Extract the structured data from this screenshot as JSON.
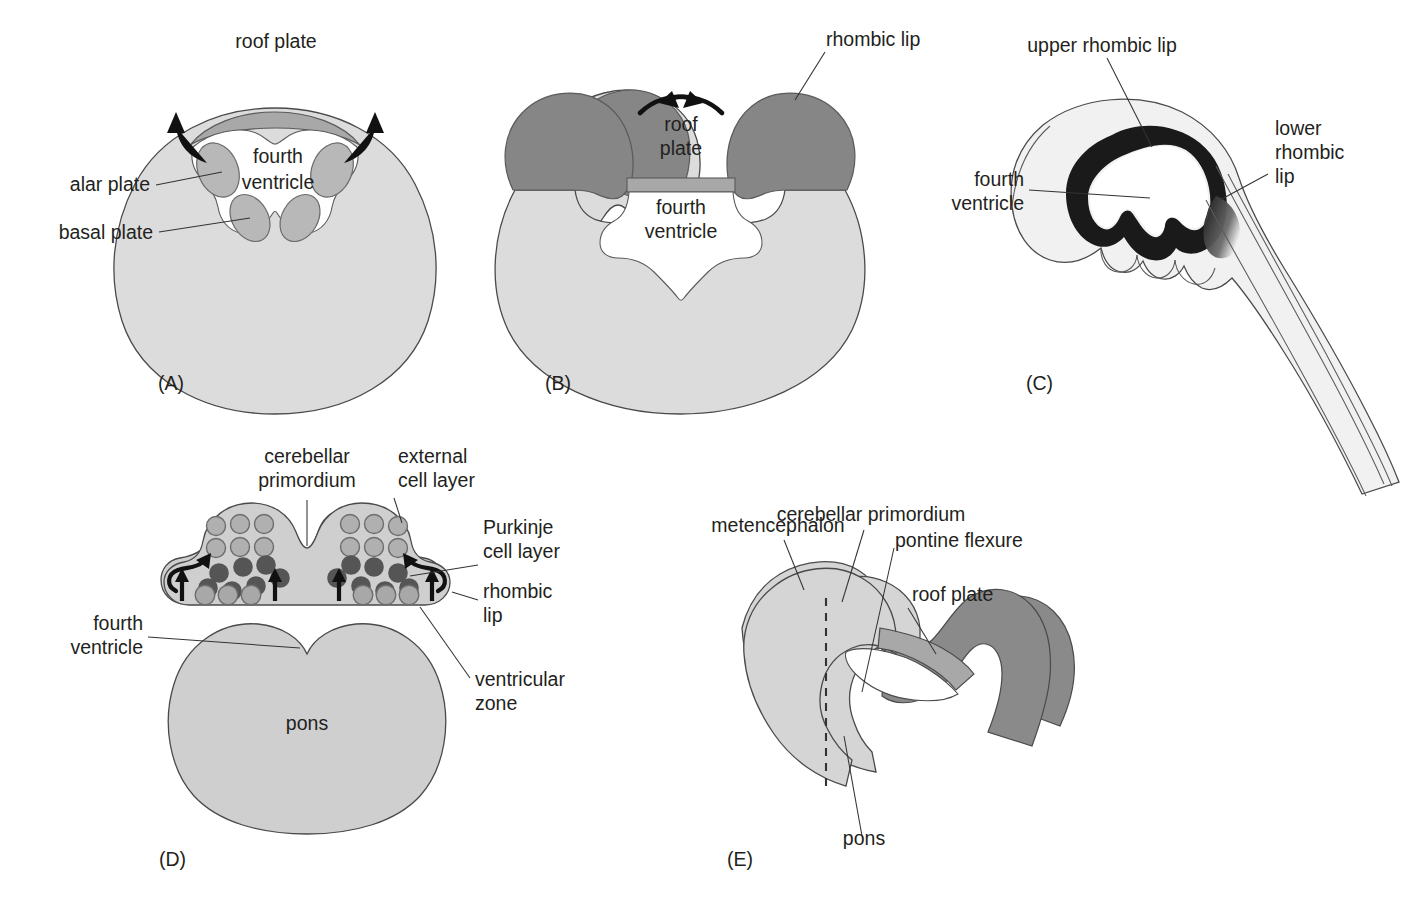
{
  "figure": {
    "background_color": "#ffffff",
    "text_color": "#231f20"
  },
  "colors": {
    "body_light_gray": "#dcdcdc",
    "mid_gray": "#b8b8b8",
    "dark_gray": "#868686",
    "roof_plate_gray": "#a8a8a8",
    "very_light_gray": "#f1f1f1",
    "black": "#1a1a1a",
    "outline": "#4a4a4a",
    "white": "#ffffff",
    "purkinje_cell": "#595959",
    "external_cell": "#b0b0b0",
    "ventricular_cell": "#a8a8a8"
  },
  "panels": [
    {
      "id": "A",
      "letter": "(A)",
      "labels": [
        {
          "name": "roof-plate",
          "text": "roof plate"
        },
        {
          "name": "fourth-ventricle-line1",
          "text": "fourth"
        },
        {
          "name": "fourth-ventricle-line2",
          "text": "ventricle"
        },
        {
          "name": "alar-plate",
          "text": "alar plate"
        },
        {
          "name": "basal-plate",
          "text": "basal plate"
        }
      ]
    },
    {
      "id": "B",
      "letter": "(B)",
      "labels": [
        {
          "name": "rhombic-lip",
          "text": "rhombic lip"
        },
        {
          "name": "roof-plate-line1",
          "text": "roof"
        },
        {
          "name": "roof-plate-line2",
          "text": "plate"
        },
        {
          "name": "fourth-ventricle-line1",
          "text": "fourth"
        },
        {
          "name": "fourth-ventricle-line2",
          "text": "ventricle"
        }
      ]
    },
    {
      "id": "C",
      "letter": "(C)",
      "labels": [
        {
          "name": "upper-rhombic-lip",
          "text": "upper rhombic lip"
        },
        {
          "name": "lower-rhombic-lip-line1",
          "text": "lower"
        },
        {
          "name": "lower-rhombic-lip-line2",
          "text": "rhombic"
        },
        {
          "name": "lower-rhombic-lip-line3",
          "text": "lip"
        },
        {
          "name": "fourth-ventricle-line1",
          "text": "fourth"
        },
        {
          "name": "fourth-ventricle-line2",
          "text": "ventricle"
        }
      ]
    },
    {
      "id": "D",
      "letter": "(D)",
      "labels": [
        {
          "name": "cerebellar-primordium-line1",
          "text": "cerebellar"
        },
        {
          "name": "cerebellar-primordium-line2",
          "text": "primordium"
        },
        {
          "name": "external-cell-layer-line1",
          "text": "external"
        },
        {
          "name": "external-cell-layer-line2",
          "text": "cell layer"
        },
        {
          "name": "purkinje-cell-layer-line1",
          "text": "Purkinje"
        },
        {
          "name": "purkinje-cell-layer-line2",
          "text": "cell layer"
        },
        {
          "name": "rhombic-lip-line1",
          "text": "rhombic"
        },
        {
          "name": "rhombic-lip-line2",
          "text": "lip"
        },
        {
          "name": "ventricular-zone-line1",
          "text": "ventricular"
        },
        {
          "name": "ventricular-zone-line2",
          "text": "zone"
        },
        {
          "name": "fourth-ventricle-line1",
          "text": "fourth"
        },
        {
          "name": "fourth-ventricle-line2",
          "text": "ventricle"
        },
        {
          "name": "pons",
          "text": "pons"
        }
      ],
      "cell_counts": {
        "external_cell_layer_per_side": 6,
        "purkinje_cells_per_side": 7,
        "ventricular_zone_cells_per_side": 3,
        "upward_arrows": 4,
        "curved_arrows": 2
      }
    },
    {
      "id": "E",
      "letter": "(E)",
      "labels": [
        {
          "name": "metencephalon",
          "text": "metencephalon"
        },
        {
          "name": "cerebellar-primordium",
          "text": "cerebellar primordium"
        },
        {
          "name": "pontine-flexure",
          "text": "pontine flexure"
        },
        {
          "name": "roof-plate",
          "text": "roof plate"
        },
        {
          "name": "pons",
          "text": "pons"
        }
      ]
    }
  ]
}
